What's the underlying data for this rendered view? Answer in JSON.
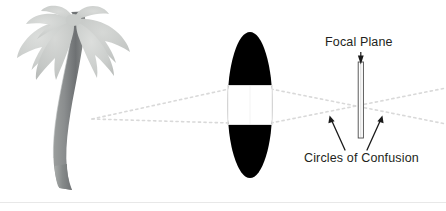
{
  "figure": {
    "type": "optical-diagram",
    "labels": {
      "focal_plane": "Focal Plane",
      "circles_of_confusion": "Circles of Confusion"
    },
    "elements": {
      "subject_icon": "palm-tree-icon",
      "lens_icon": "lens-aperture-icon",
      "focal_plane_icon": "focal-plane-bar-icon",
      "ray_style": "dotted",
      "arrow_down_icon": "arrow-down-icon",
      "arrow_left_icon": "arrow-up-left-icon",
      "arrow_right_icon": "arrow-up-right-icon",
      "baseline_icon": "horizontal-rule-icon"
    },
    "colors": {
      "lens_body": "#000000",
      "aperture": "#ffffff",
      "aperture_border": "#e2e2e2",
      "ray": "#d8d8d8",
      "text": "#231f20",
      "arrow": "#1a1a1a",
      "frond_light": "#d2d4d2",
      "frond_mid": "#c2c5c3",
      "frond_dark": "#b4b7b5",
      "trunk_light": "#a9acab",
      "trunk_dark": "#76797a",
      "baseline": "#e6e6e6"
    }
  }
}
